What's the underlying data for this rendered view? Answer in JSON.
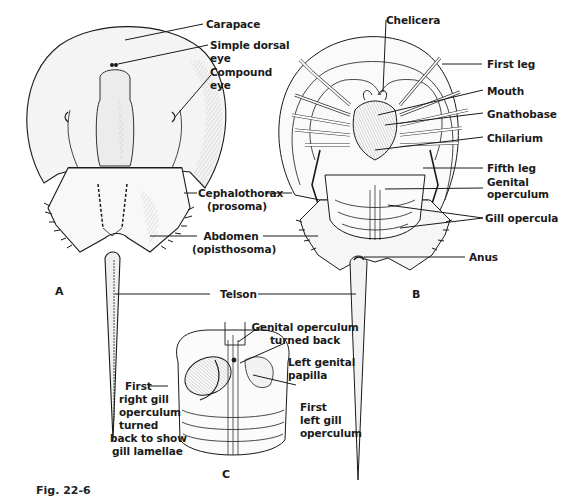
{
  "figure": {
    "caption": "Fig. 22-6",
    "panels": [
      {
        "id": "A",
        "label": "A",
        "view": "dorsal"
      },
      {
        "id": "B",
        "label": "B",
        "view": "ventral"
      },
      {
        "id": "C",
        "label": "C",
        "view": "abdomen-ventral-detail"
      }
    ],
    "labels": {
      "carapace": "Carapace",
      "simple_dorsal_eye_1": "Simple dorsal",
      "simple_dorsal_eye_2": "eye",
      "compound_eye_1": "Compound",
      "compound_eye_2": "eye",
      "cephalothorax_1": "Cephalothorax",
      "cephalothorax_2": "(prosoma)",
      "abdomen_1": "Abdomen",
      "abdomen_2": "(opisthosoma)",
      "telson": "Telson",
      "chelicera": "Chelicera",
      "first_leg": "First leg",
      "mouth": "Mouth",
      "gnathobase": "Gnathobase",
      "chilarium": "Chilarium",
      "fifth_leg": "Fifth leg",
      "genital_operculum_1": "Genital",
      "genital_operculum_2": "operculum",
      "gill_opercula": "Gill opercula",
      "anus": "Anus",
      "genital_turned_back_1": "Genital operculum",
      "genital_turned_back_2": "turned back",
      "left_genital_papilla_1": "Left genital",
      "left_genital_papilla_2": "papilla",
      "first_right_gill_1": "First",
      "first_right_gill_2": "right gill",
      "first_right_gill_3": "operculum",
      "first_right_gill_4": "turned",
      "first_right_gill_5": "back to show",
      "first_right_gill_6": "gill lamellae",
      "first_left_gill_1": "First",
      "first_left_gill_2": "left gill",
      "first_left_gill_3": "operculum"
    },
    "colors": {
      "ink": "#1a1a1a",
      "shade": "#9a9a9a",
      "background": "#ffffff"
    }
  }
}
